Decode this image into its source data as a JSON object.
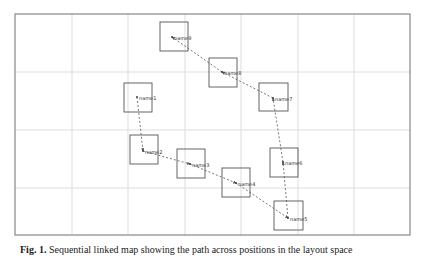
{
  "figure": {
    "frame": {
      "x": 15,
      "y": 14,
      "width": 395,
      "height": 221,
      "border_color": "#888888"
    },
    "grid": {
      "color": "#dddddd",
      "vertical_x": [
        72,
        128,
        185,
        241,
        298,
        354
      ],
      "horizontal_y": [
        72,
        130,
        188
      ]
    },
    "edge_style": {
      "color": "#555555",
      "dash": "2,2"
    },
    "nodes": [
      {
        "id": "name1",
        "label": "name1",
        "box": [
          124,
          83,
          28,
          29
        ],
        "dot": [
          137,
          97
        ]
      },
      {
        "id": "name2",
        "label": "name2",
        "box": [
          130,
          135,
          28,
          29
        ],
        "dot": [
          143,
          151
        ]
      },
      {
        "id": "name3",
        "label": "name3",
        "box": [
          177,
          149,
          28,
          29
        ],
        "dot": [
          190,
          164
        ]
      },
      {
        "id": "name4",
        "label": "name4",
        "box": [
          222,
          168,
          28,
          29
        ],
        "dot": [
          236,
          183
        ]
      },
      {
        "id": "name5",
        "label": "name5",
        "box": [
          274,
          201,
          29,
          29
        ],
        "dot": [
          288,
          218
        ]
      },
      {
        "id": "name6",
        "label": "name6",
        "box": [
          270,
          148,
          28,
          29
        ],
        "dot": [
          283,
          162
        ]
      },
      {
        "id": "name7",
        "label": "name7",
        "box": [
          259,
          83,
          29,
          28
        ],
        "dot": [
          273,
          98
        ]
      },
      {
        "id": "name8",
        "label": "name8",
        "box": [
          209,
          58,
          28,
          29
        ],
        "dot": [
          222,
          72
        ]
      },
      {
        "id": "name9",
        "label": "name9",
        "box": [
          160,
          22,
          28,
          29
        ],
        "dot": [
          172,
          37
        ]
      }
    ],
    "edges": [
      [
        "name1",
        "name2"
      ],
      [
        "name2",
        "name3"
      ],
      [
        "name3",
        "name4"
      ],
      [
        "name4",
        "name5"
      ],
      [
        "name5",
        "name6"
      ],
      [
        "name6",
        "name7"
      ],
      [
        "name7",
        "name8"
      ],
      [
        "name8",
        "name9"
      ]
    ]
  },
  "caption": {
    "prefix": "Fig. 1.",
    "text": "Sequential linked map showing the path across positions in the layout space"
  }
}
